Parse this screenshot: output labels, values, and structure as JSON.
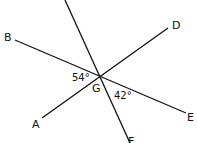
{
  "diagram": {
    "center": {
      "label": "G",
      "x": 100,
      "y": 77
    },
    "points": [
      {
        "label": "C",
        "x": 65,
        "y": 0
      },
      {
        "label": "B",
        "x": 15,
        "y": 40
      },
      {
        "label": "D",
        "x": 168,
        "y": 27
      },
      {
        "label": "A",
        "x": 42,
        "y": 118
      },
      {
        "label": "E",
        "x": 188,
        "y": 113
      },
      {
        "label": "F",
        "x": 128,
        "y": 143
      }
    ],
    "lines": [
      {
        "name": "CF",
        "x1": 65,
        "y1": 0,
        "x2": 130,
        "y2": 143
      },
      {
        "name": "BE",
        "x1": 15,
        "y1": 40,
        "x2": 186,
        "y2": 113
      },
      {
        "name": "AD",
        "x1": 42,
        "y1": 118,
        "x2": 168,
        "y2": 28
      }
    ],
    "angles": [
      {
        "label": "54°",
        "between": "BGA"
      },
      {
        "label": "42°",
        "between": "EGF"
      }
    ]
  }
}
